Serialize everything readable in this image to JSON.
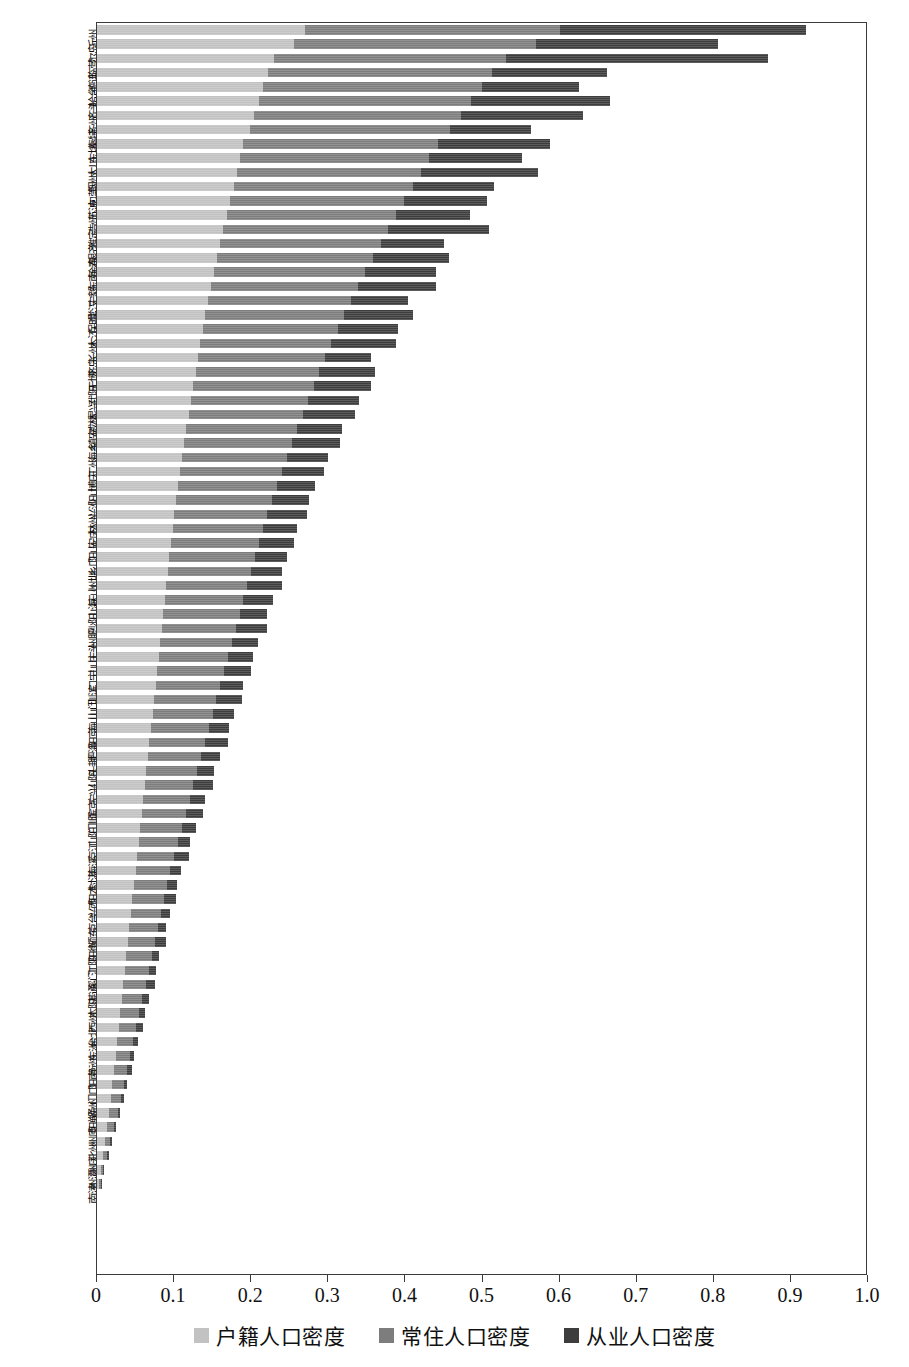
{
  "chart_data": {
    "type": "bar",
    "orientation": "horizontal",
    "stacked": true,
    "title": "",
    "xlabel": "",
    "ylabel": "",
    "xlim": [
      0,
      1.0
    ],
    "grid": false,
    "legend_position": "bottom",
    "xticklabels": [
      "0",
      "0.1",
      "0.2",
      "0.3",
      "0.4",
      "0.5",
      "0.6",
      "0.7",
      "0.8",
      "0.9",
      "1.0"
    ],
    "xticks": [
      0,
      0.1,
      0.2,
      0.3,
      0.4,
      0.5,
      0.6,
      0.7,
      0.8,
      0.9,
      1.0
    ],
    "series": [
      {
        "name": "户籍人口密度",
        "color": "#c2c2c2"
      },
      {
        "name": "常住人口密度",
        "color": "#7d7d7d"
      },
      {
        "name": "从业人口密度",
        "color": "#3d3d3d"
      }
    ],
    "categories": [
      "沂州",
      "尔岛",
      "临营",
      "德连",
      "哈台",
      "齐头",
      "齐州",
      "秦特",
      "东坊",
      "大川",
      "烟州",
      "包莞",
      "苏波",
      "浩州",
      "潍定",
      "银齐",
      "徐春",
      "东南",
      "宁毅",
      "常汉",
      "保明",
      "木江",
      "长州",
      "济岛",
      "无博",
      "武阳",
      "昆兴",
      "威林",
      "镇安",
      "海乡",
      "丁州",
      "博庆",
      "阳山",
      "兴沙",
      "林州",
      "安庄",
      "阳山",
      "乡口",
      "州圳",
      "庆山",
      "山海",
      "沙阳",
      "州肥",
      "庄头",
      "山山",
      "口宁",
      "圳滨",
      "山门",
      "海山",
      "阳京",
      "肥海",
      "头封",
      "山阳",
      "宁兴",
      "滨京",
      "门顺",
      "山阳",
      "京江",
      "海溪",
      "封湛",
      "阳本",
      "兴西",
      "京台",
      "顺东",
      "阳衡",
      "江阳",
      "溪门",
      "湛通",
      "本阳",
      "西州",
      "台北",
      "东洲",
      "衡州",
      "阳南",
      "门口",
      "通州",
      "阳郸",
      "州原",
      "北州",
      "洲庆",
      "州潭",
      "南津",
      "口昌",
      "州林",
      "郸都",
      "原湘",
      "州天",
      "州南",
      "庆桂",
      "潭成"
    ],
    "values_hujide": [
      0.27,
      0.255,
      0.23,
      0.222,
      0.215,
      0.21,
      0.204,
      0.198,
      0.19,
      0.186,
      0.182,
      0.178,
      0.172,
      0.168,
      0.164,
      0.16,
      0.156,
      0.152,
      0.148,
      0.144,
      0.14,
      0.137,
      0.134,
      0.131,
      0.128,
      0.125,
      0.122,
      0.119,
      0.116,
      0.113,
      0.11,
      0.108,
      0.105,
      0.103,
      0.1,
      0.098,
      0.096,
      0.094,
      0.092,
      0.09,
      0.088,
      0.086,
      0.084,
      0.082,
      0.08,
      0.078,
      0.076,
      0.074,
      0.072,
      0.07,
      0.068,
      0.066,
      0.064,
      0.062,
      0.06,
      0.058,
      0.056,
      0.054,
      0.052,
      0.05,
      0.048,
      0.046,
      0.044,
      0.042,
      0.04,
      0.038,
      0.036,
      0.034,
      0.032,
      0.03,
      0.028,
      0.026,
      0.024,
      0.022,
      0.02,
      0.018,
      0.016,
      0.013,
      0.01,
      0.008,
      0.005,
      0.003
    ],
    "values_changzhu": [
      0.33,
      0.315,
      0.3,
      0.29,
      0.285,
      0.275,
      0.268,
      0.26,
      0.252,
      0.245,
      0.238,
      0.232,
      0.226,
      0.22,
      0.214,
      0.208,
      0.202,
      0.196,
      0.19,
      0.185,
      0.18,
      0.175,
      0.17,
      0.165,
      0.16,
      0.156,
      0.152,
      0.148,
      0.144,
      0.14,
      0.136,
      0.132,
      0.128,
      0.124,
      0.12,
      0.117,
      0.114,
      0.111,
      0.108,
      0.105,
      0.102,
      0.099,
      0.096,
      0.093,
      0.09,
      0.087,
      0.084,
      0.081,
      0.078,
      0.075,
      0.072,
      0.069,
      0.066,
      0.063,
      0.06,
      0.057,
      0.054,
      0.051,
      0.048,
      0.045,
      0.043,
      0.041,
      0.039,
      0.037,
      0.035,
      0.033,
      0.031,
      0.029,
      0.027,
      0.025,
      0.023,
      0.021,
      0.019,
      0.017,
      0.015,
      0.013,
      0.011,
      0.009,
      0.007,
      0.005,
      0.003,
      0.002
    ],
    "values_congye": [
      0.32,
      0.235,
      0.34,
      0.15,
      0.125,
      0.18,
      0.158,
      0.105,
      0.145,
      0.12,
      0.152,
      0.105,
      0.108,
      0.096,
      0.13,
      0.082,
      0.098,
      0.092,
      0.102,
      0.075,
      0.09,
      0.078,
      0.084,
      0.06,
      0.072,
      0.074,
      0.066,
      0.068,
      0.058,
      0.062,
      0.054,
      0.055,
      0.05,
      0.048,
      0.052,
      0.044,
      0.046,
      0.042,
      0.04,
      0.045,
      0.038,
      0.036,
      0.04,
      0.034,
      0.032,
      0.035,
      0.03,
      0.033,
      0.028,
      0.026,
      0.03,
      0.024,
      0.022,
      0.026,
      0.02,
      0.023,
      0.018,
      0.016,
      0.02,
      0.014,
      0.013,
      0.016,
      0.012,
      0.011,
      0.014,
      0.01,
      0.009,
      0.012,
      0.008,
      0.007,
      0.009,
      0.006,
      0.005,
      0.007,
      0.004,
      0.004,
      0.003,
      0.003,
      0.002,
      0.002,
      0.001,
      0.001
    ],
    "edge_labels": [
      {
        "text": "沂州",
        "index": 0
      },
      {
        "text": "齐齐哈尔",
        "index": 5
      },
      {
        "text": "呼和浩特",
        "index": 13
      },
      {
        "text": "乌鲁木齐",
        "index": 22
      },
      {
        "text": "石家庄",
        "index": 37
      },
      {
        "text": "张家口",
        "index": 40
      },
      {
        "text": "平顶山",
        "index": 48
      },
      {
        "text": "哈尔滨",
        "index": 51
      }
    ]
  },
  "legend": {
    "items": [
      {
        "label": "户籍人口密度",
        "swatch": "s-a"
      },
      {
        "label": "常住人口密度",
        "swatch": "s-b"
      },
      {
        "label": "从业人口密度",
        "swatch": "s-c"
      }
    ]
  },
  "axis": {
    "x_labels": [
      "0",
      "0.1",
      "0.2",
      "0.3",
      "0.4",
      "0.5",
      "0.6",
      "0.7",
      "0.8",
      "0.9",
      "1.0"
    ]
  },
  "category_labels": [
    "沂州",
    "尔岛",
    "临营",
    "德连",
    "哈台",
    "齐头",
    "齐州",
    "秦特",
    "东坊",
    "大川",
    "烟州",
    "包莞",
    "苏波",
    "浩州",
    "潍定",
    "银齐",
    "徐春",
    "东南",
    "宁毅",
    "常汉",
    "保明",
    "木江",
    "长州",
    "济岛",
    "无博",
    "武阳",
    "昆兴",
    "威林",
    "镇安",
    "海乡",
    "丁州",
    "博庆",
    "阳山",
    "兴沙",
    "林州",
    "安庄",
    "阳山",
    "乡口",
    "州圳",
    "庆山",
    "山海",
    "沙阳",
    "州肥",
    "庄头",
    "山山",
    "口宁",
    "圳滨",
    "山门",
    "海山",
    "阳京",
    "肥海",
    "头封",
    "山阳",
    "宁兴",
    "滨京",
    "门顺",
    "山阳",
    "京江",
    "海溪",
    "封湛",
    "阳本",
    "兴西",
    "京台",
    "顺东",
    "阳衡",
    "江阳",
    "溪门",
    "湛通",
    "本阳",
    "西州",
    "台北",
    "东洲",
    "衡州",
    "阳南",
    "门口",
    "通州",
    "阳郸",
    "州原",
    "北州",
    "洲庆",
    "州潭",
    "南津"
  ]
}
